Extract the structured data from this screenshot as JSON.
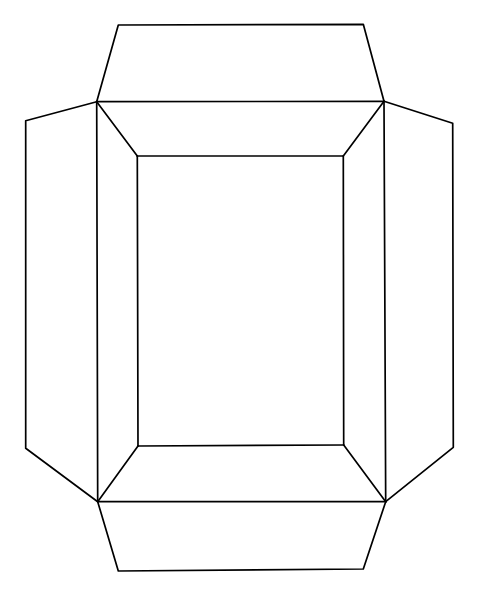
{
  "document": {
    "title": "Box Net Diagram",
    "subject": "unfolded rectangular box / carton net pattern",
    "background_color": "#ffffff",
    "line_color": "#000000",
    "line_width": 1.7,
    "canvas": {
      "width": 482,
      "height": 593
    }
  },
  "diagram": {
    "type": "line-drawing",
    "stroke_color": "#000000",
    "fill_color": "#ffffff",
    "stroke_width": 1.7,
    "vertices": {
      "base_top_left": [
        137.3,
        156.0
      ],
      "base_top_right": [
        343.3,
        156.0
      ],
      "base_bottom_right": [
        343.7,
        445.0
      ],
      "base_bottom_left": [
        138.0,
        446.0
      ],
      "fold_top_left": [
        96.7,
        101.7
      ],
      "fold_top_right": [
        384.0,
        101.3
      ],
      "fold_bottom_right": [
        385.7,
        501.7
      ],
      "fold_bottom_left": [
        97.7,
        501.7
      ],
      "top_flap_left": [
        118.3,
        25.0
      ],
      "top_flap_right": [
        363.3,
        24.3
      ],
      "bottom_flap_left": [
        118.3,
        571.0
      ],
      "bottom_flap_right": [
        363.3,
        569.0
      ],
      "left_flap_top": [
        25.7,
        120.7
      ],
      "left_flap_bottom": [
        25.7,
        448.3
      ],
      "right_flap_top": [
        452.7,
        123.3
      ],
      "right_flap_bottom": [
        453.3,
        447.3
      ],
      "left_inner_top": [
        96.7,
        101.7
      ],
      "left_inner_bottom": [
        97.7,
        501.7
      ],
      "right_inner_top": [
        384.0,
        101.3
      ],
      "right_inner_bottom": [
        385.7,
        501.7
      ]
    },
    "panels": [
      {
        "id": "base-panel",
        "name": "base-panel",
        "shape": "rectangle",
        "points": "137.3,156.0 343.3,156.0 343.7,445.0 138.0,446.0"
      },
      {
        "id": "wall-top",
        "name": "top-wall-panel",
        "shape": "trapezoid",
        "points": "96.7,101.7 384.0,101.3 343.3,156.0 137.3,156.0"
      },
      {
        "id": "wall-bottom",
        "name": "bottom-wall-panel",
        "shape": "trapezoid",
        "points": "138.0,446.0 343.7,445.0 385.7,501.7 97.7,501.7"
      },
      {
        "id": "wall-left",
        "name": "left-wall-panel",
        "shape": "trapezoid",
        "points": "96.7,101.7 137.3,156.0 138.0,446.0 97.7,501.7"
      },
      {
        "id": "wall-right",
        "name": "right-wall-panel",
        "shape": "trapezoid",
        "points": "384.0,101.3 385.7,501.7 343.7,445.0 343.3,156.0"
      },
      {
        "id": "flap-top",
        "name": "top-flap",
        "shape": "trapezoid",
        "points": "118.3,25.0 363.3,24.3 384.0,101.3 96.7,101.7"
      },
      {
        "id": "flap-bottom",
        "name": "bottom-flap",
        "shape": "trapezoid",
        "points": "97.7,501.7 385.7,501.7 363.3,569.0 118.3,571.0"
      },
      {
        "id": "flap-left",
        "name": "left-flap",
        "shape": "trapezoid",
        "points": "25.7,120.7 96.7,101.7 97.7,501.7 25.7,448.3"
      },
      {
        "id": "flap-right",
        "name": "right-flap",
        "shape": "trapezoid",
        "points": "384.0,101.3 452.7,123.3 453.3,447.3 385.7,501.7"
      }
    ],
    "fold_lines": [
      {
        "name": "fold-base-top",
        "points": "137.3,156.0 343.3,156.0"
      },
      {
        "name": "fold-base-right",
        "points": "343.3,156.0 343.7,445.0"
      },
      {
        "name": "fold-base-bottom",
        "points": "138.0,446.0 343.7,445.0"
      },
      {
        "name": "fold-base-left",
        "points": "137.3,156.0 138.0,446.0"
      },
      {
        "name": "fold-wall-top",
        "points": "96.7,101.7 384.0,101.3"
      },
      {
        "name": "fold-wall-bottom",
        "points": "97.7,501.7 385.7,501.7"
      },
      {
        "name": "fold-wall-left",
        "points": "96.7,101.7 97.7,501.7"
      },
      {
        "name": "fold-wall-right",
        "points": "384.0,101.3 385.7,501.7"
      },
      {
        "name": "miter-top-left",
        "points": "96.7,101.7 137.3,156.0"
      },
      {
        "name": "miter-top-right",
        "points": "384.0,101.3 343.3,156.0"
      },
      {
        "name": "miter-bottom-left",
        "points": "97.7,501.7 138.0,446.0"
      },
      {
        "name": "miter-bottom-right",
        "points": "385.7,501.7 343.7,445.0"
      }
    ],
    "cut_lines": [
      {
        "name": "cut-top-flap",
        "points": "96.7,101.7 118.3,25.0 363.3,24.3 384.0,101.3"
      },
      {
        "name": "cut-bottom-flap",
        "points": "97.7,501.7 118.3,571.0 363.3,569.0 385.7,501.7"
      },
      {
        "name": "cut-left-flap",
        "points": "96.7,101.7 25.7,120.7 25.7,448.3 97.7,501.7"
      },
      {
        "name": "cut-right-flap",
        "points": "384.0,101.3 452.7,123.3 453.3,447.3 385.7,501.7"
      }
    ],
    "labels": []
  }
}
